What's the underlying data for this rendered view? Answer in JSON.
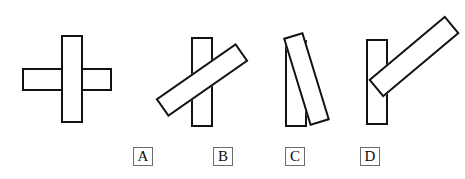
{
  "image": {
    "kind": "multiple-choice-figure-options",
    "background_color": "#ffffff",
    "stroke_color": "#121212",
    "width": 465,
    "height": 179
  },
  "options": [
    {
      "label": "A",
      "description": "Two rectangles crossing at 90 degrees forming a plus sign",
      "label_x": 133,
      "label_y": 147,
      "shapes": [
        {
          "name": "horizontal-bar",
          "angle_deg": 90,
          "x": 22,
          "y": 68,
          "width": 90,
          "height": 23
        },
        {
          "name": "vertical-bar",
          "angle_deg": 0,
          "x": 61,
          "y": 35,
          "width": 22,
          "height": 88
        }
      ]
    },
    {
      "label": "B",
      "description": "Vertical rectangle crossed by a rectangle rotated about 55 degrees",
      "label_x": 213,
      "label_y": 147,
      "shapes": [
        {
          "name": "vertical-bar",
          "angle_deg": 0,
          "x": 191,
          "y": 37,
          "width": 22,
          "height": 90
        },
        {
          "name": "tilted-bar",
          "angle_deg": 55,
          "cx": 202,
          "cy": 80,
          "length": 98,
          "thickness": 22
        }
      ]
    },
    {
      "label": "C",
      "description": "Vertical rectangle overlapped near the top by a rectangle rotated about 17 degrees",
      "label_x": 285,
      "label_y": 147,
      "shapes": [
        {
          "name": "vertical-bar",
          "angle_deg": 0,
          "x": 285,
          "y": 40,
          "width": 22,
          "height": 87
        },
        {
          "name": "tilted-bar",
          "angle_deg": 17,
          "cx": 307,
          "cy": 79,
          "length": 92,
          "thickness": 21
        }
      ]
    },
    {
      "label": "D",
      "description": "Vertical rectangle beside a separated rectangle rotated about 40 degrees, no overlap",
      "label_x": 360,
      "label_y": 147,
      "shapes": [
        {
          "name": "vertical-bar",
          "angle_deg": 0,
          "x": 366,
          "y": 39,
          "width": 22,
          "height": 86
        },
        {
          "name": "tilted-bar",
          "angle_deg": 40,
          "cx": 414,
          "cy": 57,
          "length": 100,
          "thickness": 23
        }
      ]
    }
  ],
  "labels": {
    "a": "A",
    "b": "B",
    "c": "C",
    "d": "D"
  }
}
